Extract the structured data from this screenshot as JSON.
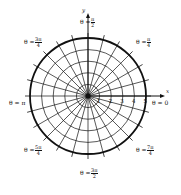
{
  "diagram": {
    "type": "polar-grid",
    "center": [
      88,
      96
    ],
    "radius_px": 58,
    "num_circles": 5,
    "num_rays": 24,
    "axis": {
      "x_label": "x",
      "y_label": "y",
      "radial_ticks": [
        "1",
        "2",
        "3",
        "4",
        "5"
      ]
    },
    "angle_labels": [
      {
        "prefix": "θ =",
        "num": "π",
        "den": "2",
        "name": "angle-pi-over-2"
      },
      {
        "prefix": "θ =",
        "num": "π",
        "den": "4",
        "name": "angle-pi-over-4"
      },
      {
        "prefix": "θ =",
        "num": "3π",
        "den": "4",
        "name": "angle-3pi-over-4"
      },
      {
        "prefix": "θ = π",
        "num": "",
        "den": "",
        "name": "angle-pi"
      },
      {
        "prefix": "θ = 0",
        "num": "",
        "den": "",
        "name": "angle-0"
      },
      {
        "prefix": "θ =",
        "num": "5π",
        "den": "4",
        "name": "angle-5pi-over-4"
      },
      {
        "prefix": "θ =",
        "num": "7π",
        "den": "4",
        "name": "angle-7pi-over-4"
      },
      {
        "prefix": "θ =",
        "num": "3π",
        "den": "2",
        "name": "angle-3pi-over-2"
      }
    ],
    "colors": {
      "line": "#111111",
      "background": "#ffffff"
    }
  }
}
